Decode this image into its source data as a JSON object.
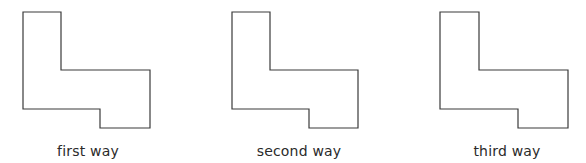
{
  "figures": [
    {
      "label": "first way",
      "points": "23,12 61,12 61,70 150,70 150,128 100,128 100,109 23,109",
      "label_x": 88
    },
    {
      "label": "second way",
      "points": "232,12 270,12 270,70 358,70 358,128 309,128 309,109 232,109",
      "label_x": 299
    },
    {
      "label": "third way",
      "points": "440,12 479,12 479,70 568,70 568,128 518,128 518,109 440,109",
      "label_x": 507
    }
  ],
  "colors": {
    "stroke": "#3a3a3a",
    "text": "#2a2a2a",
    "background": "#ffffff"
  }
}
